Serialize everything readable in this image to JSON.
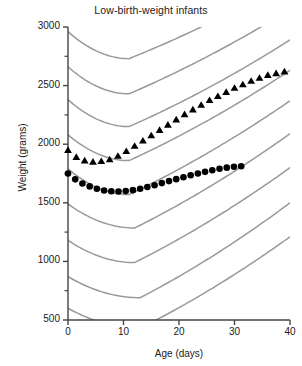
{
  "chart_data": {
    "type": "scatter",
    "title": "Low-birth-weight infants",
    "xlabel": "Age (days)",
    "ylabel": "Weight (grams)",
    "xlim": [
      0,
      40
    ],
    "ylim": [
      500,
      3000
    ],
    "xticks": [
      0,
      10,
      20,
      30,
      40
    ],
    "yticks": [
      500,
      1000,
      1500,
      2000,
      2500,
      3000
    ],
    "y_minor_ticks": [
      750,
      1250,
      1750,
      2250,
      2750
    ],
    "grid": false,
    "legend": "none",
    "marker_color": "#000000",
    "reference_curve_color": "#999999",
    "axis_color": "#444444",
    "series": [
      {
        "name": "triangle-series",
        "marker": "triangle",
        "color": "#000000",
        "x": [
          0,
          1.5,
          3,
          4.5,
          6,
          7.5,
          9,
          10.5,
          12,
          13.5,
          15,
          16.5,
          18,
          19.5,
          21,
          22.5,
          24,
          25.5,
          27,
          28.5,
          30,
          31.5,
          33,
          34.5,
          36,
          37.5,
          39
        ],
        "y": [
          1950,
          1890,
          1860,
          1850,
          1855,
          1870,
          1900,
          1940,
          1985,
          2030,
          2075,
          2120,
          2165,
          2210,
          2255,
          2295,
          2335,
          2375,
          2410,
          2445,
          2480,
          2510,
          2540,
          2565,
          2590,
          2605,
          2620
        ]
      },
      {
        "name": "circle-series",
        "marker": "circle",
        "color": "#000000",
        "x": [
          0,
          1.3,
          2.6,
          3.9,
          5.2,
          6.5,
          7.8,
          9.1,
          10.4,
          11.7,
          13,
          14.3,
          15.6,
          16.9,
          18.2,
          19.5,
          20.8,
          22.1,
          23.4,
          24.7,
          26,
          27.3,
          28.6,
          29.9,
          31.2
        ],
        "y": [
          1750,
          1700,
          1665,
          1640,
          1620,
          1605,
          1598,
          1596,
          1600,
          1608,
          1620,
          1635,
          1650,
          1668,
          1685,
          1702,
          1718,
          1735,
          1750,
          1764,
          1778,
          1790,
          1800,
          1807,
          1812
        ]
      }
    ],
    "reference_curves": [
      {
        "name": "percentile-curve-1",
        "start_y": 2960,
        "min_y": 2730,
        "min_x": 11,
        "end_y": 3400
      },
      {
        "name": "percentile-curve-2",
        "start_y": 2660,
        "min_y": 2430,
        "min_x": 11,
        "end_y": 3150
      },
      {
        "name": "percentile-curve-3",
        "start_y": 2380,
        "min_y": 2150,
        "min_x": 11,
        "end_y": 2890
      },
      {
        "name": "percentile-curve-4",
        "start_y": 2080,
        "min_y": 1860,
        "min_x": 11,
        "end_y": 2630
      },
      {
        "name": "percentile-curve-5",
        "start_y": 1790,
        "min_y": 1570,
        "min_x": 11,
        "end_y": 2370
      },
      {
        "name": "percentile-curve-6",
        "start_y": 1490,
        "min_y": 1285,
        "min_x": 12,
        "end_y": 2090
      },
      {
        "name": "percentile-curve-7",
        "start_y": 1180,
        "min_y": 990,
        "min_x": 12,
        "end_y": 1800
      },
      {
        "name": "percentile-curve-8",
        "start_y": 870,
        "min_y": 690,
        "min_x": 13,
        "end_y": 1500
      },
      {
        "name": "percentile-curve-9",
        "start_y": 600,
        "min_y": 430,
        "min_x": 13,
        "end_y": 1210
      }
    ]
  },
  "caption": ""
}
